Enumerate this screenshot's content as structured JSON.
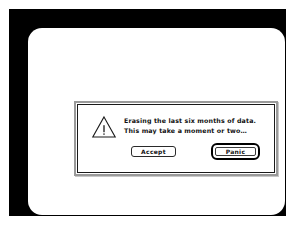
{
  "screen": {
    "bezel_color": "#000000",
    "surface_color": "#ffffff"
  },
  "dialog": {
    "icon": "warning-triangle-icon",
    "border_color": "#9a9a9a",
    "inner_border_color": "#1a1a1a",
    "background": "#ffffff",
    "message": {
      "line1": "Erasing the last six months of data.",
      "line2": "This may take a moment or two…"
    },
    "buttons": {
      "accept_label": "Accept",
      "panic_label": "Panic",
      "default_button": "Panic"
    }
  }
}
